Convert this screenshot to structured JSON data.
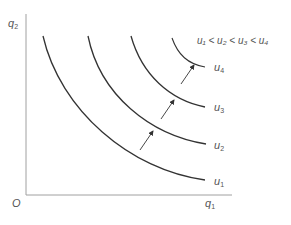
{
  "figure": {
    "caption_top": "",
    "caption_bottom": "",
    "axes": {
      "origin_label": "O",
      "x_label": "q",
      "x_label_sub": "1",
      "y_label": "q",
      "y_label_sub": "2"
    },
    "inequality": "u₁ < u₂ < u₃ < u₄",
    "curves": [
      {
        "label": "u",
        "sub": "1",
        "color": "#333333"
      },
      {
        "label": "u",
        "sub": "2",
        "color": "#333333"
      },
      {
        "label": "u",
        "sub": "3",
        "color": "#333333"
      },
      {
        "label": "u",
        "sub": "4",
        "color": "#333333"
      }
    ],
    "arrows_count": 3,
    "colors": {
      "axis": "#999999",
      "curve": "#333333",
      "text": "#555555"
    }
  }
}
